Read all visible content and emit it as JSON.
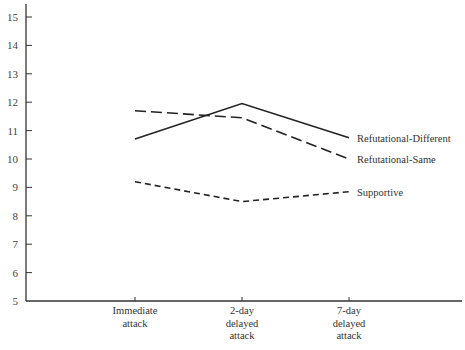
{
  "chart_data": {
    "type": "line",
    "title": "",
    "xlabel": "",
    "ylabel": "",
    "ylim": [
      5,
      15
    ],
    "yticks": [
      5,
      6,
      7,
      8,
      9,
      10,
      11,
      12,
      13,
      14,
      15
    ],
    "grid": false,
    "legend_position": "inline-right",
    "categories": [
      [
        "Immediate",
        "attack"
      ],
      [
        "2-day",
        "delayed",
        "attack"
      ],
      [
        "7-day",
        "delayed",
        "attack"
      ]
    ],
    "categories_flat": [
      "Immediate attack",
      "2-day delayed attack",
      "7-day delayed attack"
    ],
    "series": [
      {
        "name": "Refutational-Different",
        "style": "solid",
        "values": [
          10.7,
          11.95,
          10.75
        ]
      },
      {
        "name": "Refutational-Same",
        "style": "long-dash",
        "values": [
          11.7,
          11.45,
          10.0
        ]
      },
      {
        "name": "Supportive",
        "style": "short-dash",
        "values": [
          9.2,
          8.5,
          8.85
        ]
      }
    ]
  },
  "layout": {
    "axis_color": "#333333",
    "line_color": "#222222",
    "plot": {
      "x0": 26,
      "y0": 301,
      "x_end": 462,
      "y_top": 17,
      "y_axis_top": 4
    },
    "cat_x": [
      135,
      242,
      349
    ]
  }
}
